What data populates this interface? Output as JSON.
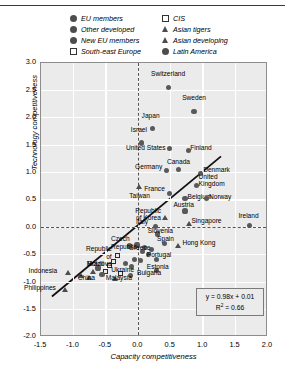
{
  "legend": {
    "items": [
      {
        "label": "EU members",
        "marker": "circle",
        "col": 0
      },
      {
        "label": "Other developed",
        "marker": "circle",
        "col": 0
      },
      {
        "label": "New EU members",
        "marker": "circle",
        "col": 0
      },
      {
        "label": "South-east Europe",
        "marker": "square",
        "col": 0
      },
      {
        "label": "CIS",
        "marker": "square",
        "col": 1
      },
      {
        "label": "Asian tigers",
        "marker": "tri",
        "col": 1
      },
      {
        "label": "Asian developing",
        "marker": "tri",
        "col": 1
      },
      {
        "label": "Latin America",
        "marker": "circle",
        "col": 1
      }
    ]
  },
  "equation": {
    "fit": "y = 0.98x + 0.01",
    "r2_prefix": "R",
    "r2_sup": "2",
    "r2_rest": " = 0.66"
  },
  "chart_data": {
    "type": "scatter",
    "title": "",
    "xlabel": "Capacity competitiveness",
    "ylabel": "Technology competitiveness",
    "xlim": [
      -1.5,
      2.0
    ],
    "ylim": [
      -2.0,
      3.0
    ],
    "xticks": [
      "-1.5",
      "-1.0",
      "-0.5",
      "0.0",
      "0.5",
      "1.0",
      "1.5",
      "2.0"
    ],
    "yticks": [
      "3.0",
      "2.5",
      "2.0",
      "1.5",
      "1.0",
      "0.5",
      "0.0",
      "-0.5",
      "-1.0",
      "-1.5",
      "-2.0"
    ],
    "grid": true,
    "legend_position": "top",
    "trendline": {
      "slope": 0.98,
      "intercept": 0.01,
      "r2": 0.66,
      "x_start": -1.33,
      "x_end": 1.3
    },
    "reference_lines": {
      "x": 0.0,
      "y": 0.0
    },
    "points": [
      {
        "name": "Switzerland",
        "x": 0.46,
        "y": 2.56,
        "marker": "circle",
        "lx": 0.46,
        "ly": 2.8,
        "align": "center"
      },
      {
        "name": "Sweden",
        "x": 0.86,
        "y": 2.12,
        "marker": "circle",
        "lx": 0.86,
        "ly": 2.36,
        "align": "center"
      },
      {
        "name": "Japan",
        "x": 0.22,
        "y": 1.8,
        "marker": "circle",
        "lx": 0.19,
        "ly": 2.04,
        "align": "center"
      },
      {
        "name": "Israel",
        "x": 0.05,
        "y": 1.54,
        "marker": "circle",
        "lx": 0.01,
        "ly": 1.78,
        "align": "center"
      },
      {
        "name": "United States",
        "x": 0.48,
        "y": 1.44,
        "marker": "circle",
        "lx": 0.45,
        "ly": 1.45,
        "align": "right"
      },
      {
        "name": "Finland",
        "x": 0.77,
        "y": 1.41,
        "marker": "circle",
        "lx": 0.8,
        "ly": 1.45,
        "align": "left"
      },
      {
        "name": "Germany",
        "x": 0.44,
        "y": 1.04,
        "marker": "circle",
        "lx": 0.4,
        "ly": 1.1,
        "align": "right"
      },
      {
        "name": "Canada",
        "x": 0.62,
        "y": 1.06,
        "marker": "circle",
        "lx": 0.62,
        "ly": 1.2,
        "align": "center"
      },
      {
        "name": "Denmark",
        "x": 0.96,
        "y": 0.98,
        "marker": "circle",
        "lx": 1.0,
        "ly": 1.04,
        "align": "left"
      },
      {
        "name": "United Kingdom",
        "x": 0.9,
        "y": 0.76,
        "marker": "circle",
        "lx": 0.93,
        "ly": 0.92,
        "align": "left",
        "wrap": true
      },
      {
        "name": "France",
        "x": 0.48,
        "y": 0.62,
        "marker": "circle",
        "lx": 0.44,
        "ly": 0.7,
        "align": "right"
      },
      {
        "name": "Belgium",
        "x": 0.72,
        "y": 0.52,
        "marker": "circle",
        "lx": 0.76,
        "ly": 0.56,
        "align": "left"
      },
      {
        "name": "Norway",
        "x": 1.05,
        "y": 0.52,
        "marker": "circle",
        "lx": 1.09,
        "ly": 0.56,
        "align": "left"
      },
      {
        "name": "Taiwan",
        "x": 0.02,
        "y": 0.74,
        "marker": "tri",
        "lx": 0.02,
        "ly": 0.58,
        "align": "center"
      },
      {
        "name": "Austria",
        "x": 0.72,
        "y": 0.3,
        "marker": "circle",
        "lx": 0.7,
        "ly": 0.4,
        "align": "center"
      },
      {
        "name": "Republic of Korea",
        "x": 0.42,
        "y": 0.18,
        "marker": "tri",
        "lx": 0.38,
        "ly": 0.3,
        "align": "right",
        "wrap": true
      },
      {
        "name": "Singapore",
        "x": 0.78,
        "y": 0.06,
        "marker": "tri",
        "lx": 0.82,
        "ly": 0.12,
        "align": "left"
      },
      {
        "name": "Ireland",
        "x": 1.72,
        "y": 0.04,
        "marker": "circle",
        "lx": 1.7,
        "ly": 0.2,
        "align": "center"
      },
      {
        "name": "Italy",
        "x": 0.26,
        "y": 0.02,
        "marker": "circle",
        "lx": 0.18,
        "ly": 0.1,
        "align": "right"
      },
      {
        "name": "Slovenia",
        "x": 0.3,
        "y": -0.12,
        "marker": "circle",
        "lx": 0.34,
        "ly": -0.06,
        "align": "center"
      },
      {
        "name": "Spain",
        "x": 0.4,
        "y": -0.3,
        "marker": "circle",
        "lx": 0.42,
        "ly": -0.22,
        "align": "center"
      },
      {
        "name": "Hong Kong",
        "x": 0.62,
        "y": -0.34,
        "marker": "tri",
        "lx": 0.68,
        "ly": -0.28,
        "align": "left"
      },
      {
        "name": "Portugal",
        "x": 0.28,
        "y": -0.58,
        "marker": "circle",
        "lx": 0.32,
        "ly": -0.5,
        "align": "center"
      },
      {
        "name": "Greece",
        "x": 0.06,
        "y": -0.44,
        "marker": "circle",
        "lx": 0.02,
        "ly": -0.38,
        "align": "center"
      },
      {
        "name": "Estonia",
        "x": 0.28,
        "y": -0.78,
        "marker": "circle",
        "lx": 0.3,
        "ly": -0.72,
        "align": "center"
      },
      {
        "name": "Czech Republic",
        "x": -0.14,
        "y": -0.34,
        "marker": "circle",
        "lx": -0.22,
        "ly": -0.22,
        "align": "center",
        "wrap": true
      },
      {
        "name": "Republic of Moldova",
        "x": -0.32,
        "y": -0.52,
        "marker": "square",
        "lx": -0.38,
        "ly": -0.4,
        "align": "right",
        "wrap": true
      },
      {
        "name": "Brazil",
        "x": -0.62,
        "y": -0.74,
        "marker": "circle",
        "lx": -0.66,
        "ly": -0.66,
        "align": "center"
      },
      {
        "name": "Ukraine",
        "x": -0.28,
        "y": -0.84,
        "marker": "square",
        "lx": -0.24,
        "ly": -0.78,
        "align": "center"
      },
      {
        "name": "Bulgaria",
        "x": -0.12,
        "y": -0.88,
        "marker": "circle",
        "lx": -0.02,
        "ly": -0.84,
        "align": "left"
      },
      {
        "name": "Malaysia",
        "x": -0.36,
        "y": -0.94,
        "marker": "tri",
        "lx": -0.3,
        "ly": -0.92,
        "align": "center"
      },
      {
        "name": "China",
        "x": -0.76,
        "y": -0.92,
        "marker": "tri",
        "lx": -0.8,
        "ly": -0.92,
        "align": "center"
      },
      {
        "name": "Indonesia",
        "x": -1.08,
        "y": -0.84,
        "marker": "tri",
        "lx": -1.22,
        "ly": -0.8,
        "align": "right"
      },
      {
        "name": "Philippines",
        "x": -1.12,
        "y": -1.14,
        "marker": "tri",
        "lx": -1.24,
        "ly": -1.1,
        "align": "right"
      }
    ],
    "extra_points": [
      {
        "x": -0.02,
        "y": -0.32,
        "marker": "circle"
      },
      {
        "x": 0.1,
        "y": -0.36,
        "marker": "circle"
      },
      {
        "x": 0.16,
        "y": -0.5,
        "marker": "circle"
      },
      {
        "x": 0.04,
        "y": -0.6,
        "marker": "circle"
      },
      {
        "x": -0.06,
        "y": -0.58,
        "marker": "circle"
      },
      {
        "x": 0.2,
        "y": -0.4,
        "marker": "circle"
      },
      {
        "x": -0.44,
        "y": -0.7,
        "marker": "square"
      },
      {
        "x": -0.5,
        "y": -0.8,
        "marker": "square"
      },
      {
        "x": -0.38,
        "y": -0.62,
        "marker": "square"
      },
      {
        "x": -0.56,
        "y": -0.86,
        "marker": "circle"
      },
      {
        "x": -0.7,
        "y": -0.82,
        "marker": "tri"
      },
      {
        "x": -0.88,
        "y": -0.88,
        "marker": "tri"
      },
      {
        "x": -0.2,
        "y": -0.66,
        "marker": "circle"
      },
      {
        "x": -0.1,
        "y": -0.72,
        "marker": "circle"
      }
    ]
  }
}
